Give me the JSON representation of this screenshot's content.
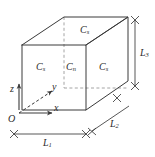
{
  "figure": {
    "type": "3d-box-diagram",
    "colors": {
      "line": "#3a3a3a",
      "dashed": "#8a8a8a",
      "text": "#2b2b2b",
      "background": "#ffffff"
    }
  },
  "faces": {
    "top": {
      "symbol": "C",
      "subscript": "s"
    },
    "left": {
      "symbol": "C",
      "subscript": "s"
    },
    "middle": {
      "symbol": "C",
      "subscript": "n"
    },
    "right": {
      "symbol": "C",
      "subscript": "s"
    }
  },
  "axes": {
    "x": "x",
    "y": "y",
    "z": "z",
    "origin": "O"
  },
  "dimensions": {
    "bottom": {
      "symbol": "L",
      "subscript": "1"
    },
    "depth": {
      "symbol": "L",
      "subscript": "2"
    },
    "height": {
      "symbol": "L",
      "subscript": "3"
    }
  }
}
